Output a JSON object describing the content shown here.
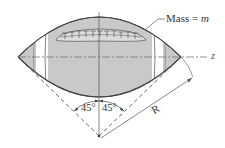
{
  "diagram": {
    "labels": {
      "mass_prefix": "Mass = ",
      "mass_symbol": "m",
      "axis": "z",
      "angle_left": "45°",
      "angle_right": "45°",
      "radius": "R"
    },
    "colors": {
      "ball_fill": "#c8c8c8",
      "ball_outline": "#444444",
      "line": "#555555",
      "background": "#ffffff"
    }
  }
}
